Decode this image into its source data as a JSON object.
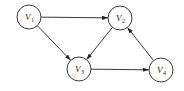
{
  "diagram": {
    "type": "directed-graph",
    "nodes": [
      {
        "id": "V1",
        "label": "V",
        "sub": "1",
        "cx": 29,
        "cy": 17
      },
      {
        "id": "V2",
        "label": "V",
        "sub": "2",
        "cx": 120,
        "cy": 18
      },
      {
        "id": "V3",
        "label": "V",
        "sub": "3",
        "cx": 79,
        "cy": 69
      },
      {
        "id": "V4",
        "label": "V",
        "sub": "4",
        "cx": 161,
        "cy": 70
      }
    ],
    "edges": [
      {
        "from": "V1",
        "to": "V2"
      },
      {
        "from": "V1",
        "to": "V3"
      },
      {
        "from": "V2",
        "to": "V3"
      },
      {
        "from": "V3",
        "to": "V4"
      },
      {
        "from": "V4",
        "to": "V2"
      }
    ],
    "colors": {
      "stroke": "#3a3a3a",
      "background": "#ffffff"
    }
  }
}
